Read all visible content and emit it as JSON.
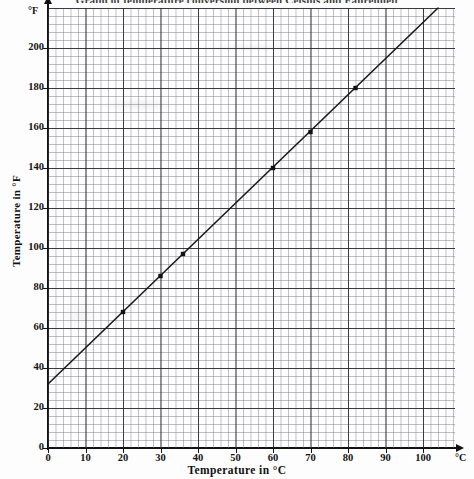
{
  "chart_data": {
    "type": "line",
    "title": "Graph of temperature conversion between Celsius and Fahrenheit",
    "xlabel": "Temperature in °C",
    "ylabel": "Temperature in °F",
    "x_unit": "°C",
    "y_unit": "°F",
    "xlim": [
      0,
      108
    ],
    "ylim": [
      0,
      224
    ],
    "x_ticks": [
      0,
      10,
      20,
      30,
      40,
      50,
      60,
      70,
      80,
      90,
      100
    ],
    "y_ticks": [
      0,
      20,
      40,
      60,
      80,
      100,
      120,
      140,
      160,
      180,
      200
    ],
    "x_tick_labels": [
      "0",
      "10",
      "20",
      "30",
      "40",
      "50",
      "60",
      "70",
      "80",
      "90",
      "100"
    ],
    "y_tick_labels": [
      "0",
      "20",
      "40",
      "60",
      "80",
      "100",
      "120",
      "140",
      "160",
      "180",
      "200"
    ],
    "grid": true,
    "grid_minor_step_x": 2,
    "grid_minor_step_y": 4,
    "grid_major_step_x": 10,
    "grid_major_step_y": 20,
    "legend": null,
    "line_color": "#1b1b1b",
    "relation": "F = 1.8 × C + 32",
    "series": [
      {
        "name": "Celsius to Fahrenheit conversion line",
        "type": "line",
        "endpoints": [
          {
            "x": 0,
            "y": 32
          },
          {
            "x": 104,
            "y": 220
          }
        ]
      },
      {
        "name": "Plotted readings",
        "type": "scatter",
        "points": [
          {
            "x": 20,
            "y": 68
          },
          {
            "x": 30,
            "y": 86
          },
          {
            "x": 36,
            "y": 97
          },
          {
            "x": 60,
            "y": 140
          },
          {
            "x": 70,
            "y": 158
          },
          {
            "x": 82,
            "y": 180
          }
        ]
      }
    ]
  }
}
